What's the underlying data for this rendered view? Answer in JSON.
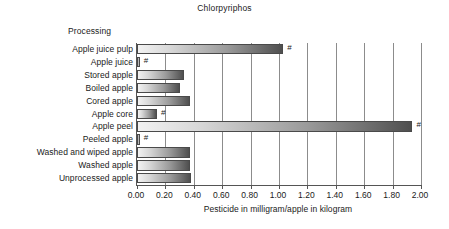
{
  "chart_data": {
    "type": "bar",
    "orientation": "horizontal",
    "title": "Chlorpyriphos",
    "group_label": "Processing",
    "xlabel": "Pesticide in milligram/apple in kilogram",
    "ylabel": "",
    "xlim": [
      0.0,
      2.0
    ],
    "xticks": [
      "0.00",
      "0.20",
      "0.40",
      "0.60",
      "0.80",
      "1.00",
      "1.20",
      "1.40",
      "1.60",
      "1.80",
      "2.00"
    ],
    "xtick_values": [
      0.0,
      0.2,
      0.4,
      0.6,
      0.8,
      1.0,
      1.2,
      1.4,
      1.6,
      1.8,
      2.0
    ],
    "grid": "vertical",
    "legend": "none",
    "annotation_symbol": "#",
    "categories": [
      "Apple juice pulp",
      "Apple juice",
      "Stored apple",
      "Boiled apple",
      "Cored apple",
      "Apple core",
      "Apple peel",
      "Peeled apple",
      "Washed and wiped apple",
      "Washed apple",
      "Unprocessed apple"
    ],
    "values": [
      1.03,
      0.02,
      0.33,
      0.3,
      0.37,
      0.14,
      1.94,
      0.02,
      0.37,
      0.37,
      0.38
    ],
    "marked": [
      true,
      true,
      false,
      false,
      false,
      true,
      true,
      true,
      false,
      false,
      false
    ],
    "bars": [
      {
        "label": "Apple juice pulp",
        "value": 1.03,
        "marker": "#"
      },
      {
        "label": "Apple juice",
        "value": 0.02,
        "marker": "#"
      },
      {
        "label": "Stored apple",
        "value": 0.33,
        "marker": ""
      },
      {
        "label": "Boiled apple",
        "value": 0.3,
        "marker": ""
      },
      {
        "label": "Cored apple",
        "value": 0.37,
        "marker": ""
      },
      {
        "label": "Apple core",
        "value": 0.14,
        "marker": "#"
      },
      {
        "label": "Apple peel",
        "value": 1.94,
        "marker": "#"
      },
      {
        "label": "Peeled apple",
        "value": 0.02,
        "marker": "#"
      },
      {
        "label": "Washed and wiped apple",
        "value": 0.37,
        "marker": ""
      },
      {
        "label": "Washed apple",
        "value": 0.37,
        "marker": ""
      },
      {
        "label": "Unprocessed apple",
        "value": 0.38,
        "marker": ""
      }
    ]
  },
  "colors": {
    "background": "#ffffff",
    "text": "#1a1a1a",
    "axis": "#555555",
    "gridline": "#8c8c8c",
    "bar_light": "#f2f2f2",
    "bar_dark": "#4f4f4f",
    "bar_border": "#4a4a4a"
  }
}
